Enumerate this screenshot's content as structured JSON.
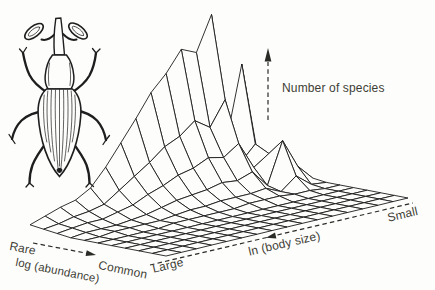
{
  "figure": {
    "background_color": "#fdfdfc",
    "ink_color": "#1c1c1c",
    "text_color": "#3d3d35",
    "illustration": "weevil-beetle-line-drawing"
  },
  "chart_data": {
    "type": "surface",
    "render_style": "3d-wireframe-mesh-hidden-line",
    "axes": {
      "x": {
        "label": "ln (body size)",
        "left_end": "Large",
        "right_end": "Small",
        "arrow_points_to": "Large"
      },
      "y": {
        "label": "log (abundance)",
        "near_end": "Rare",
        "far_end": "Common",
        "arrow_points_to": "Common"
      },
      "z": {
        "label": "Number of species",
        "numeric_ticks": "none shown"
      }
    },
    "grid_cols_bodysize": 17,
    "grid_rows_abundance": 11,
    "z_scale_note": "relative heights 0-1 estimated from wireframe silhouette",
    "z_values": [
      [
        0.03,
        0.06,
        0.09,
        0.11,
        0.16,
        0.26,
        0.38,
        0.5,
        0.63,
        0.72,
        0.84,
        0.8,
        1.0,
        0.25,
        0.67,
        0.15,
        0.05
      ],
      [
        0.02,
        0.03,
        0.05,
        0.06,
        0.08,
        0.14,
        0.2,
        0.26,
        0.33,
        0.37,
        0.44,
        0.38,
        0.52,
        0.13,
        0.22,
        0.08,
        0.03
      ],
      [
        0.01,
        0.02,
        0.03,
        0.03,
        0.05,
        0.07,
        0.11,
        0.14,
        0.18,
        0.2,
        0.24,
        0.22,
        0.28,
        0.12,
        0.18,
        0.04,
        0.01
      ],
      [
        0.0,
        0.01,
        0.01,
        0.01,
        0.02,
        0.03,
        0.05,
        0.07,
        0.08,
        0.09,
        0.11,
        0.1,
        0.13,
        0.03,
        0.27,
        0.1,
        0.01
      ],
      [
        0.0,
        0.0,
        0.01,
        0.01,
        0.01,
        0.01,
        0.02,
        0.03,
        0.03,
        0.04,
        0.04,
        0.04,
        0.05,
        0.01,
        0.08,
        0.01,
        0.0
      ],
      [
        0.0,
        0.0,
        0.0,
        0.0,
        0.0,
        0.01,
        0.01,
        0.01,
        0.01,
        0.01,
        0.02,
        0.02,
        0.02,
        0.01,
        0.01,
        0.0,
        0.0
      ],
      [
        0,
        0,
        0,
        0,
        0,
        0,
        0,
        0,
        0,
        0,
        0,
        0,
        0,
        0,
        0,
        0,
        0
      ],
      [
        0,
        0,
        0,
        0,
        0,
        0,
        0,
        0,
        0,
        0,
        0,
        0,
        0,
        0,
        0,
        0,
        0
      ],
      [
        0,
        0,
        0,
        0,
        0,
        0,
        0,
        0,
        0,
        0,
        0,
        0,
        0,
        0,
        0,
        0,
        0
      ],
      [
        0,
        0,
        0,
        0,
        0,
        0,
        0,
        0,
        0,
        0,
        0,
        0,
        0,
        0,
        0,
        0,
        0
      ],
      [
        0,
        0,
        0,
        0,
        0,
        0,
        0,
        0,
        0,
        0,
        0,
        0,
        0,
        0,
        0,
        0,
        0
      ]
    ]
  }
}
